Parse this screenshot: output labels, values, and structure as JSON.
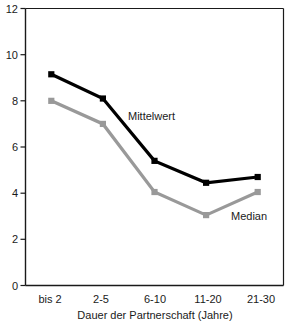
{
  "chart_data": {
    "type": "line",
    "title": "",
    "subtitle": "",
    "xlabel": "Dauer der Partnerschaft (Jahre)",
    "ylabel": "",
    "categories": [
      "bis 2",
      "2-5",
      "6-10",
      "11-20",
      "21-30"
    ],
    "series": [
      {
        "name": "Mittelwert",
        "values": [
          9.15,
          8.1,
          5.4,
          4.45,
          4.7
        ],
        "color": "#000000",
        "marker": "square"
      },
      {
        "name": "Median",
        "values": [
          8.0,
          7.0,
          4.05,
          3.05,
          4.05
        ],
        "color": "#999999",
        "marker": "square"
      }
    ],
    "ylim": [
      0,
      12
    ],
    "yticks": [
      0,
      2,
      4,
      6,
      8,
      10,
      12
    ],
    "ytick_labels": [
      "0",
      "2",
      "4",
      "6",
      "8",
      "10",
      "12"
    ],
    "grid": false,
    "legend_position": "inline-annotations",
    "annotations": [
      {
        "text": "Mittelwert",
        "category_index": 2,
        "value": 6.5
      },
      {
        "text": "Median",
        "category_index": 4,
        "value": 2.9
      }
    ],
    "frame_color": "#000000",
    "background": "#ffffff"
  },
  "axes": {
    "y_tick_labels": [
      "12",
      "10",
      "8",
      "6",
      "4",
      "2",
      "0"
    ],
    "x_tick_labels": [
      "bis 2",
      "2-5",
      "6-10",
      "11-20",
      "21-30"
    ],
    "x_axis_title": "Dauer der Partnerschaft (Jahre)"
  },
  "annotations": {
    "mittelwert_label": "Mittelwert",
    "median_label": "Median"
  }
}
